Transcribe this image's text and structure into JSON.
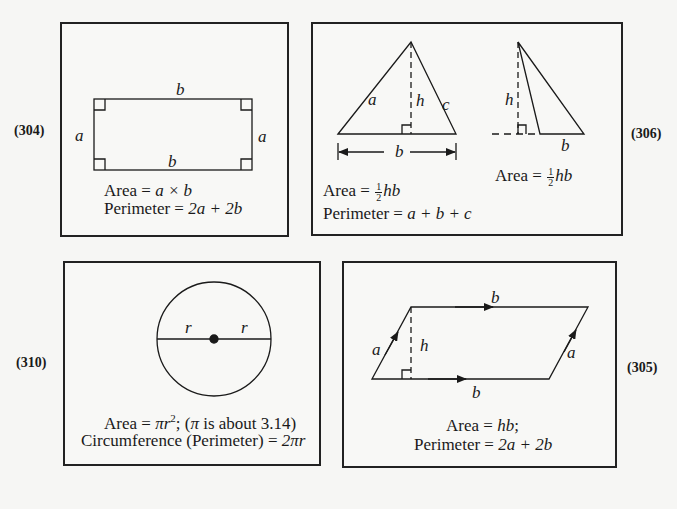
{
  "panels": {
    "rectangle": {
      "number": "(304)",
      "labels": {
        "top": "b",
        "bottom": "b",
        "left": "a",
        "right": "a"
      },
      "area": {
        "prefix": "Area = ",
        "expr": "a × b"
      },
      "perimeter": {
        "prefix": "Perimeter = ",
        "expr": "2a + 2b"
      }
    },
    "triangle": {
      "number": "(306)",
      "labels": {
        "a": "a",
        "c": "c",
        "h": "h",
        "b": "b",
        "h2": "h",
        "b2": "b"
      },
      "area": {
        "prefix": "Area = ",
        "num": "1",
        "den": "2",
        "expr": "hb"
      },
      "perimeter": {
        "prefix": "Perimeter = ",
        "expr": "a + b + c"
      },
      "area2": {
        "prefix": "Area = ",
        "num": "1",
        "den": "2",
        "expr": "hb"
      }
    },
    "circle": {
      "number": "(310)",
      "labels": {
        "r_left": "r",
        "r_right": "r"
      },
      "area": {
        "prefix": "Area = ",
        "expr": "πr",
        "exp": "2",
        "note_open": "; (",
        "pi": "π",
        "note": " is about 3.14)"
      },
      "circumference": {
        "prefix": "Circumference (Perimeter) = ",
        "expr": "2πr"
      }
    },
    "parallelogram": {
      "number": "(305)",
      "labels": {
        "top": "b",
        "bottom": "b",
        "left": "a",
        "right": "a",
        "h": "h"
      },
      "area": {
        "prefix": "Area = ",
        "expr": "hb",
        "suffix": ";"
      },
      "perimeter": {
        "prefix": "Perimeter = ",
        "expr": "2a + 2b"
      }
    }
  }
}
